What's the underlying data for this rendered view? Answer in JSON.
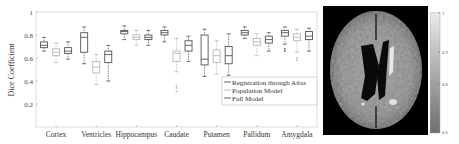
{
  "chart_data": {
    "type": "box",
    "title": "",
    "xlabel": "",
    "ylabel": "Dice Coefficient",
    "ylim": [
      0,
      1
    ],
    "yticks": [
      "0.2",
      "0.4",
      "0.6",
      "0.8",
      "1"
    ],
    "ytick_values": [
      0.2,
      0.4,
      0.6,
      0.8,
      1.0
    ],
    "grid": false,
    "legend_position": "lower-right",
    "categories": [
      "Cortex",
      "Ventricles",
      "Hippocampus",
      "Caudate",
      "Putamen",
      "Pallidum",
      "Amygdala"
    ],
    "series": [
      {
        "name": "Registration through Atlas",
        "color": "#555555",
        "boxes": [
          {
            "whislo": 0.66,
            "q1": 0.69,
            "med": 0.71,
            "q3": 0.74,
            "whishi": 0.78,
            "outliers": []
          },
          {
            "whislo": 0.55,
            "q1": 0.65,
            "med": 0.78,
            "q3": 0.82,
            "whishi": 0.87,
            "outliers": []
          },
          {
            "whislo": 0.76,
            "q1": 0.81,
            "med": 0.83,
            "q3": 0.84,
            "whishi": 0.88,
            "outliers": []
          },
          {
            "whislo": 0.74,
            "q1": 0.8,
            "med": 0.82,
            "q3": 0.84,
            "whishi": 0.87,
            "outliers": []
          },
          {
            "whislo": 0.44,
            "q1": 0.54,
            "med": 0.59,
            "q3": 0.8,
            "whishi": 0.85,
            "outliers": []
          },
          {
            "whislo": 0.77,
            "q1": 0.8,
            "med": 0.82,
            "q3": 0.84,
            "whishi": 0.87,
            "outliers": []
          },
          {
            "whislo": 0.72,
            "q1": 0.79,
            "med": 0.82,
            "q3": 0.84,
            "whishi": 0.87,
            "outliers": [
              0.68,
              0.66
            ]
          }
        ]
      },
      {
        "name": "Population Model",
        "color": "#b8b8b8",
        "boxes": [
          {
            "whislo": 0.56,
            "q1": 0.62,
            "med": 0.65,
            "q3": 0.68,
            "whishi": 0.73,
            "outliers": []
          },
          {
            "whislo": 0.37,
            "q1": 0.47,
            "med": 0.52,
            "q3": 0.57,
            "whishi": 0.63,
            "outliers": []
          },
          {
            "whislo": 0.71,
            "q1": 0.76,
            "med": 0.78,
            "q3": 0.8,
            "whishi": 0.84,
            "outliers": []
          },
          {
            "whislo": 0.48,
            "q1": 0.57,
            "med": 0.64,
            "q3": 0.66,
            "whishi": 0.77,
            "outliers": [
              0.36,
              0.34,
              0.31
            ]
          },
          {
            "whislo": 0.46,
            "q1": 0.56,
            "med": 0.62,
            "q3": 0.67,
            "whishi": 0.75,
            "outliers": []
          },
          {
            "whislo": 0.62,
            "q1": 0.71,
            "med": 0.74,
            "q3": 0.77,
            "whishi": 0.81,
            "outliers": []
          },
          {
            "whislo": 0.65,
            "q1": 0.75,
            "med": 0.78,
            "q3": 0.81,
            "whishi": 0.85,
            "outliers": [
              0.6,
              0.58
            ]
          }
        ]
      },
      {
        "name": "Full Model",
        "color": "#555555",
        "boxes": [
          {
            "whislo": 0.59,
            "q1": 0.64,
            "med": 0.66,
            "q3": 0.69,
            "whishi": 0.74,
            "outliers": []
          },
          {
            "whislo": 0.4,
            "q1": 0.56,
            "med": 0.63,
            "q3": 0.66,
            "whishi": 0.71,
            "outliers": []
          },
          {
            "whislo": 0.71,
            "q1": 0.76,
            "med": 0.78,
            "q3": 0.8,
            "whishi": 0.84,
            "outliers": []
          },
          {
            "whislo": 0.57,
            "q1": 0.66,
            "med": 0.71,
            "q3": 0.75,
            "whishi": 0.79,
            "outliers": []
          },
          {
            "whislo": 0.45,
            "q1": 0.55,
            "med": 0.62,
            "q3": 0.7,
            "whishi": 0.81,
            "outliers": []
          },
          {
            "whislo": 0.66,
            "q1": 0.73,
            "med": 0.76,
            "q3": 0.79,
            "whishi": 0.82,
            "outliers": []
          },
          {
            "whislo": 0.66,
            "q1": 0.76,
            "med": 0.79,
            "q3": 0.83,
            "whishi": 0.86,
            "outliers": []
          }
        ]
      }
    ]
  },
  "figure": {
    "ylabel": "Dice Coefficient",
    "legend": [
      "Registration through Atlas",
      "Population Model",
      "Full Model"
    ],
    "image_panel": "brain MRI axial slice",
    "colorbar": {
      "ticks": [
        "1",
        "0.9",
        "0.8",
        "0.6"
      ],
      "colors": {
        "top": "#ebebeb",
        "bottom": "#6e6e6e"
      }
    }
  }
}
